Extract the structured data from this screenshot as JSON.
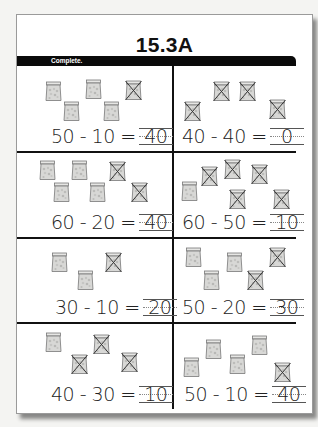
{
  "page": {
    "title": "15.3A",
    "instruction": "Complete."
  },
  "problems": [
    {
      "expression": "50 - 10 =",
      "answer": "40",
      "total_bags": 5,
      "crossed_bags": 1
    },
    {
      "expression": "40 - 40 =",
      "answer": "0",
      "total_bags": 4,
      "crossed_bags": 4
    },
    {
      "expression": "60 - 20 =",
      "answer": "40",
      "total_bags": 6,
      "crossed_bags": 2
    },
    {
      "expression": "60 - 50 =",
      "answer": "10",
      "total_bags": 6,
      "crossed_bags": 5
    },
    {
      "expression": "30 - 10 =",
      "answer": "20",
      "total_bags": 3,
      "crossed_bags": 1
    },
    {
      "expression": "50 - 20 =",
      "answer": "30",
      "total_bags": 5,
      "crossed_bags": 2
    },
    {
      "expression": "40 - 30 =",
      "answer": "10",
      "total_bags": 4,
      "crossed_bags": 3
    },
    {
      "expression": "50 - 10 =",
      "answer": "40",
      "total_bags": 5,
      "crossed_bags": 1
    }
  ],
  "icons": {
    "bag": "bag-of-ten-icon",
    "crossed_bag": "crossed-out-bag-icon"
  },
  "colors": {
    "bar": "#0a0a0a",
    "bag_fill": "#d8d8d6",
    "ink": "#222222"
  }
}
